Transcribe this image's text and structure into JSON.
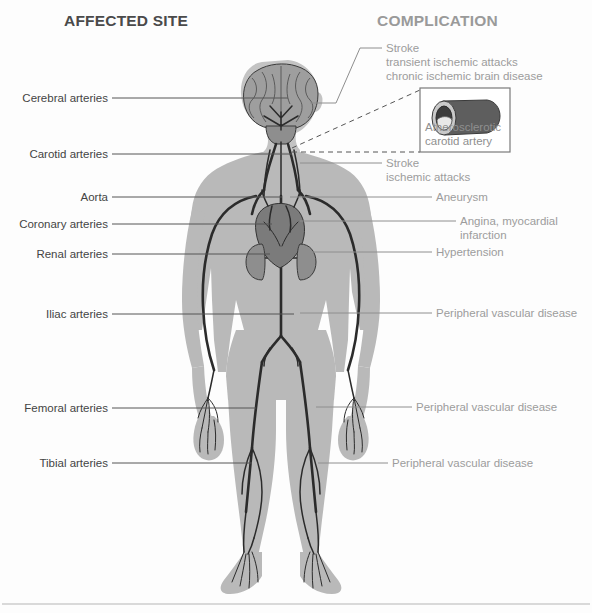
{
  "figure": {
    "title_left": "AFFECTED SITE",
    "title_right": "COMPLICATION"
  },
  "affected_sites": [
    {
      "id": "cerebral",
      "label": "Cerebral arteries"
    },
    {
      "id": "carotid",
      "label": "Carotid arteries"
    },
    {
      "id": "aorta",
      "label": "Aorta"
    },
    {
      "id": "coronary",
      "label": "Coronary arteries"
    },
    {
      "id": "renal",
      "label": "Renal arteries"
    },
    {
      "id": "iliac",
      "label": "Iliac arteries"
    },
    {
      "id": "femoral",
      "label": "Femoral arteries"
    },
    {
      "id": "tibial",
      "label": "Tibial arteries"
    }
  ],
  "complications": [
    {
      "id": "cerebral",
      "lines": [
        "Stroke",
        "transient ischemic attacks",
        "chronic ischemic brain disease"
      ],
      "line1": "Stroke",
      "line2": "transient ischemic attacks",
      "line3": "chronic ischemic brain disease"
    },
    {
      "id": "carotid",
      "lines": [
        "Stroke",
        "ischemic attacks"
      ],
      "line1": "Stroke",
      "line2": "ischemic attacks"
    },
    {
      "id": "aorta",
      "lines": [
        "Aneurysm"
      ],
      "line1": "Aneurysm"
    },
    {
      "id": "coronary",
      "lines": [
        "Angina, myocardial",
        "infarction"
      ],
      "line1": "Angina, myocardial",
      "line2": "infarction"
    },
    {
      "id": "renal",
      "lines": [
        "Hypertension"
      ],
      "line1": "Hypertension"
    },
    {
      "id": "iliac",
      "lines": [
        "Peripheral vascular disease"
      ],
      "line1": "Peripheral vascular disease"
    },
    {
      "id": "femoral",
      "lines": [
        "Peripheral vascular disease"
      ],
      "line1": "Peripheral vascular disease"
    },
    {
      "id": "tibial",
      "lines": [
        "Peripheral vascular disease"
      ],
      "line1": "Peripheral vascular disease"
    }
  ],
  "inset": {
    "caption_line1": "Atherosclerotic",
    "caption_line2": "carotid artery",
    "depicts": "cutaway-artery-with-plaque"
  },
  "colors": {
    "heading_left": "#4a4a4a",
    "heading_right": "#9a9a9a",
    "label_left": "#444444",
    "label_right": "#9c9c9c",
    "body_silhouette": "#b9b9b9",
    "artery": "#2b2b2b",
    "leader_left": "#555555",
    "leader_right": "#8e8e8e",
    "footer_rule": "#b5b5b5"
  }
}
